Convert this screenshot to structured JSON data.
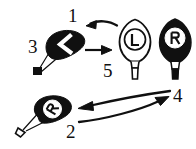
{
  "figure": {
    "background_color": "#ffffff",
    "ink_color": "#101010",
    "width": 196,
    "height": 149
  },
  "labels": {
    "one": "1",
    "two": "2",
    "three": "3",
    "four": "4",
    "five": "5"
  },
  "balloons": [
    {
      "id": "balloon-3",
      "number": "3",
      "letter": "L",
      "fill": "solid-black",
      "letter_color": "#ffffff",
      "orientation": "rotated-left-90",
      "basket": "solid-black",
      "position": {
        "x": 48,
        "y": 30
      }
    },
    {
      "id": "balloon-5",
      "number": "5",
      "letter": "L",
      "fill": "outline-white",
      "letter_color": "#101010",
      "orientation": "upright",
      "basket": "outline-white",
      "position": {
        "x": 118,
        "y": 18
      }
    },
    {
      "id": "balloon-r-upright",
      "number": "",
      "letter": "R",
      "fill": "solid-black",
      "letter_color": "#101010",
      "orientation": "upright",
      "basket": "outline-white-with-black-tip",
      "position": {
        "x": 157,
        "y": 18
      }
    },
    {
      "id": "balloon-2",
      "number": "2",
      "letter": "R",
      "fill": "solid-black",
      "letter_color": "#101010",
      "orientation": "tilted-left",
      "basket": "outline-white",
      "position": {
        "x": 32,
        "y": 98
      }
    }
  ],
  "arrows": [
    {
      "id": "arrow-1",
      "label": "1",
      "style": "curved",
      "direction": "right-to-left",
      "from": "balloon-5",
      "to": "balloon-3"
    },
    {
      "id": "arrow-straight",
      "label": "",
      "style": "straight",
      "direction": "left-to-right",
      "from": "balloon-3",
      "to": "balloon-5"
    },
    {
      "id": "arrow-4-upper",
      "label": "4",
      "style": "curved",
      "direction": "right-to-left",
      "from": "balloon-r-upright",
      "to": "balloon-2"
    },
    {
      "id": "arrow-4-lower",
      "label": "4",
      "style": "curved",
      "direction": "left-to-right",
      "from": "balloon-2",
      "to": "balloon-r-upright"
    }
  ]
}
